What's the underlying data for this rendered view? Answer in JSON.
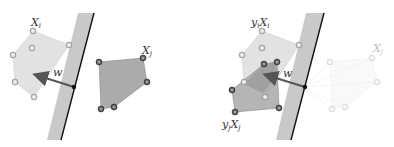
{
  "left_panel": {
    "labels": {
      "xi": "X",
      "xi_sub": "i",
      "xj": "X",
      "xj_sub": "j",
      "w": "w"
    }
  },
  "right_panel": {
    "labels": {
      "yixi_y": "y",
      "yixi_ysub": "i",
      "yixi_x": "X",
      "yixi_xsub": "i",
      "yjxj_y": "y",
      "yjxj_ysub": "j",
      "yjxj_x": "X",
      "yjxj_xsub": "j",
      "xj_faded": "X",
      "xj_faded_sub": "j",
      "w": "w"
    }
  },
  "colors": {
    "band": "#c8c8c8",
    "line": "#111111",
    "xi_fill": "#e0e0e0",
    "xj_fill": "#aaaaaa",
    "arrow": "#555555",
    "point_light": "#b8b8b8",
    "point_dark": "#555555"
  }
}
